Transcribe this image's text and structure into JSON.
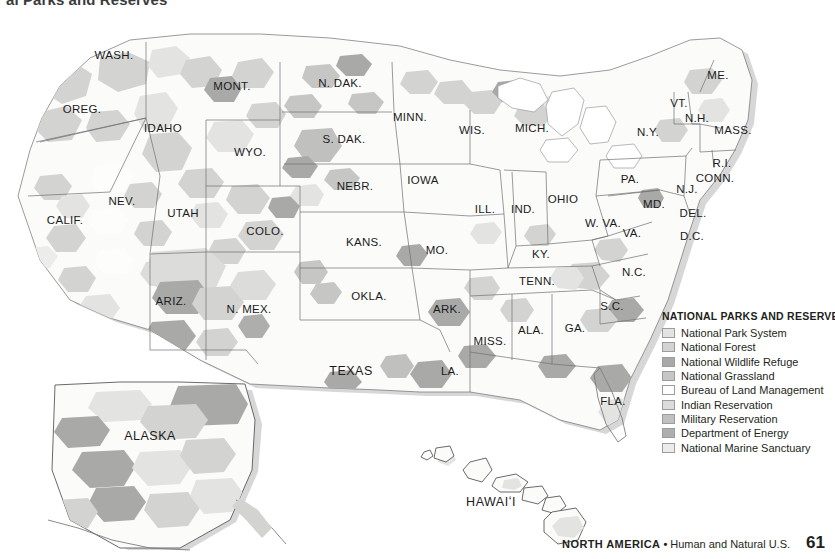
{
  "page_title": "al Parks and Reserves",
  "legend": {
    "title": "NATIONAL PARKS AND RESERVES",
    "items": [
      {
        "label": "National Park System",
        "color": "#e3e3e1",
        "swatch": "park-swatch"
      },
      {
        "label": "National Forest",
        "color": "#d3d4d2",
        "swatch": "forest-swatch"
      },
      {
        "label": "National Wildlife Refuge",
        "color": "#a9aaa8",
        "swatch": "wildlife-swatch"
      },
      {
        "label": "National Grassland",
        "color": "#c6c7c5",
        "swatch": "grassland-swatch"
      },
      {
        "label": "Bureau of Land Management",
        "color": "#fdfdfc",
        "swatch": "blm-swatch"
      },
      {
        "label": "Indian Reservation",
        "color": "#dcdddb",
        "swatch": "indian-swatch"
      },
      {
        "label": "Military Reservation",
        "color": "#c0c1bf",
        "swatch": "military-swatch"
      },
      {
        "label": "Department of Energy",
        "color": "#aeafad",
        "swatch": "energy-swatch"
      },
      {
        "label": "National Marine Sanctuary",
        "color": "#ececeb",
        "swatch": "marine-swatch"
      }
    ]
  },
  "footer": {
    "region": "NORTH AMERICA",
    "separator": "•",
    "subject": "Human and Natural U.S.",
    "page_number": "61"
  },
  "map": {
    "state_labels": [
      {
        "name": "WASH.",
        "x": 114,
        "y": 55,
        "size": "normal"
      },
      {
        "name": "OREG.",
        "x": 82,
        "y": 109,
        "size": "normal"
      },
      {
        "name": "IDAHO",
        "x": 163,
        "y": 128,
        "size": "normal"
      },
      {
        "name": "MONT.",
        "x": 232,
        "y": 86,
        "size": "normal"
      },
      {
        "name": "WYO.",
        "x": 250,
        "y": 152,
        "size": "normal"
      },
      {
        "name": "NEV.",
        "x": 122,
        "y": 201,
        "size": "normal"
      },
      {
        "name": "UTAH",
        "x": 183,
        "y": 213,
        "size": "normal"
      },
      {
        "name": "CALIF.",
        "x": 65,
        "y": 220,
        "size": "normal"
      },
      {
        "name": "COLO.",
        "x": 265,
        "y": 231,
        "size": "normal"
      },
      {
        "name": "ARIZ.",
        "x": 171,
        "y": 301,
        "size": "normal"
      },
      {
        "name": "N. MEX.",
        "x": 249,
        "y": 309,
        "size": "normal"
      },
      {
        "name": "N. DAK.",
        "x": 340,
        "y": 83,
        "size": "normal"
      },
      {
        "name": "S. DAK.",
        "x": 344,
        "y": 139,
        "size": "normal"
      },
      {
        "name": "NEBR.",
        "x": 355,
        "y": 186,
        "size": "normal"
      },
      {
        "name": "KANS.",
        "x": 364,
        "y": 242,
        "size": "normal"
      },
      {
        "name": "OKLA.",
        "x": 369,
        "y": 296,
        "size": "normal"
      },
      {
        "name": "TEXAS",
        "x": 351,
        "y": 371,
        "size": "big"
      },
      {
        "name": "MINN.",
        "x": 410,
        "y": 117,
        "size": "normal"
      },
      {
        "name": "IOWA",
        "x": 423,
        "y": 180,
        "size": "normal"
      },
      {
        "name": "MO.",
        "x": 437,
        "y": 250,
        "size": "normal"
      },
      {
        "name": "ARK.",
        "x": 447,
        "y": 309,
        "size": "normal"
      },
      {
        "name": "LA.",
        "x": 450,
        "y": 371,
        "size": "normal"
      },
      {
        "name": "WIS.",
        "x": 472,
        "y": 130,
        "size": "normal"
      },
      {
        "name": "ILL.",
        "x": 485,
        "y": 209,
        "size": "normal"
      },
      {
        "name": "IND.",
        "x": 523,
        "y": 209,
        "size": "normal"
      },
      {
        "name": "MISS.",
        "x": 490,
        "y": 341,
        "size": "normal"
      },
      {
        "name": "MICH.",
        "x": 532,
        "y": 128,
        "size": "normal"
      },
      {
        "name": "OHIO",
        "x": 563,
        "y": 199,
        "size": "normal"
      },
      {
        "name": "KY.",
        "x": 541,
        "y": 254,
        "size": "normal"
      },
      {
        "name": "TENN.",
        "x": 537,
        "y": 281,
        "size": "normal"
      },
      {
        "name": "ALA.",
        "x": 531,
        "y": 330,
        "size": "normal"
      },
      {
        "name": "GA.",
        "x": 575,
        "y": 328,
        "size": "normal"
      },
      {
        "name": "FLA.",
        "x": 613,
        "y": 401,
        "size": "normal"
      },
      {
        "name": "S.C.",
        "x": 612,
        "y": 306,
        "size": "normal"
      },
      {
        "name": "N.C.",
        "x": 634,
        "y": 272,
        "size": "normal"
      },
      {
        "name": "VA.",
        "x": 632,
        "y": 233,
        "size": "normal"
      },
      {
        "name": "W. VA.",
        "x": 603,
        "y": 223,
        "size": "normal"
      },
      {
        "name": "MD.",
        "x": 654,
        "y": 204,
        "size": "normal"
      },
      {
        "name": "DEL.",
        "x": 693,
        "y": 213,
        "size": "normal"
      },
      {
        "name": "D.C.",
        "x": 692,
        "y": 236,
        "size": "normal"
      },
      {
        "name": "PA.",
        "x": 630,
        "y": 179,
        "size": "normal"
      },
      {
        "name": "N.J.",
        "x": 687,
        "y": 189,
        "size": "normal"
      },
      {
        "name": "N.Y.",
        "x": 648,
        "y": 132,
        "size": "normal"
      },
      {
        "name": "CONN.",
        "x": 715,
        "y": 178,
        "size": "normal"
      },
      {
        "name": "R.I.",
        "x": 722,
        "y": 163,
        "size": "normal"
      },
      {
        "name": "MASS.",
        "x": 733,
        "y": 130,
        "size": "normal"
      },
      {
        "name": "N.H.",
        "x": 697,
        "y": 118,
        "size": "normal"
      },
      {
        "name": "VT.",
        "x": 679,
        "y": 103,
        "size": "normal"
      },
      {
        "name": "ME.",
        "x": 718,
        "y": 75,
        "size": "normal"
      },
      {
        "name": "ALASKA",
        "x": 150,
        "y": 436,
        "size": "big"
      },
      {
        "name": "HAWAIʻI",
        "x": 491,
        "y": 502,
        "size": "big"
      }
    ]
  }
}
